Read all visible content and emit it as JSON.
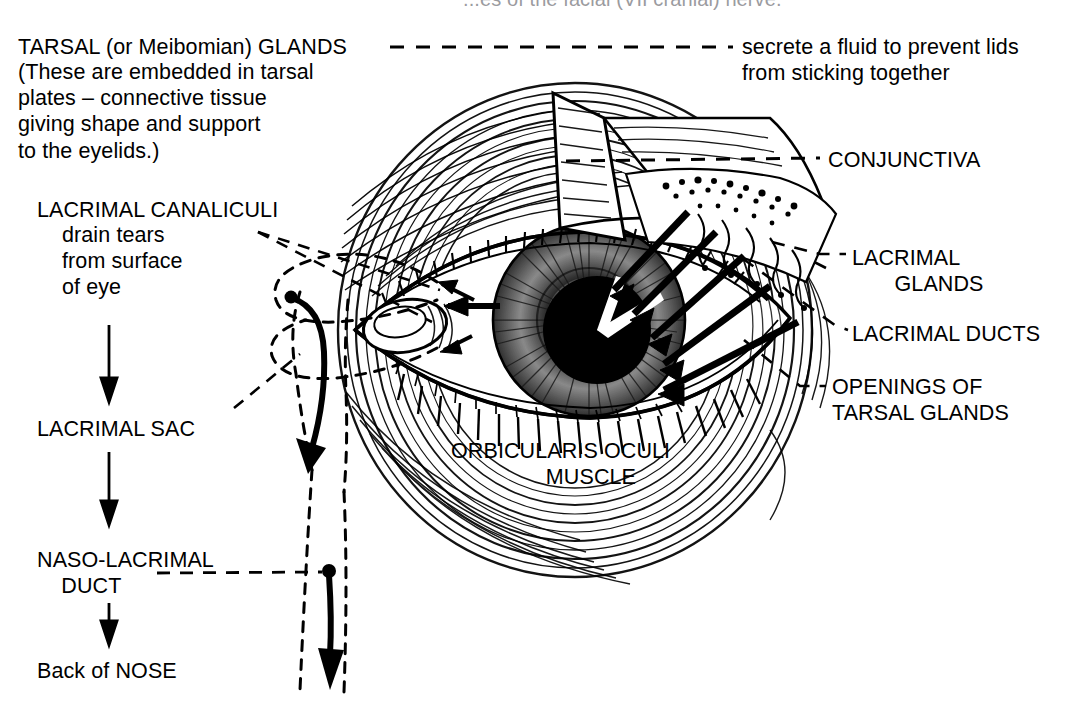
{
  "figure": {
    "kind": "anatomical-line-drawing",
    "background_color": "#ffffff",
    "ink_color": "#000000"
  },
  "clipped_top_line": {
    "text": "...es of the facial (VII cranial) nerve."
  },
  "tarsal": {
    "title": "TARSAL (or Meibomian) GLANDS",
    "note": "(These are embedded in tarsal\nplates – connective tissue\ngiving shape and support\nto the eyelids.)",
    "function": "secrete a fluid to prevent lids\nfrom sticking together"
  },
  "tear_drainage_flow": {
    "title": "LACRIMAL CANALICULI",
    "subtitle": "drain tears\nfrom surface\nof eye",
    "steps": [
      "LACRIMAL CANALICULI",
      "LACRIMAL SAC",
      "NASO-LACRIMAL\n    DUCT",
      "Back of NOSE"
    ],
    "step_lacrimal_sac": "LACRIMAL SAC",
    "step_naso_duct": "NASO-LACRIMAL\n    DUCT",
    "step_back_of_nose": "Back of NOSE"
  },
  "right_labels": {
    "conjunctiva": "CONJUNCTIVA",
    "lacrimal_glands": "LACRIMAL\n       GLANDS",
    "lacrimal_ducts": "LACRIMAL DUCTS",
    "openings_of_tarsal_glands": "OPENINGS OF\nTARSAL GLANDS"
  },
  "center_label": {
    "orbicularis_oculi": "ORBICULARIS OCULI\n          MUSCLE"
  },
  "illustration_parts": [
    "eyelid-upper",
    "eyelid-lower",
    "eyelashes",
    "iris",
    "pupil",
    "sclera",
    "lacrimal-caruncle",
    "tear-flow-arrows",
    "orbicularis-oculi-striations"
  ]
}
